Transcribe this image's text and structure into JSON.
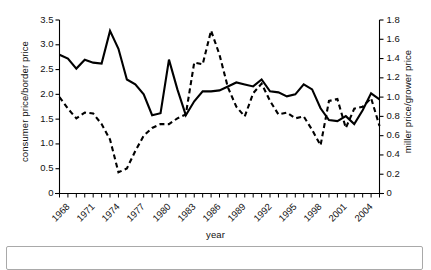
{
  "chart_data": {
    "type": "line",
    "title": "",
    "xlabel": "year",
    "ylabel": "consumer price/border price",
    "y2label": "miller price/grower price",
    "grid": false,
    "legend": "none",
    "xlim": [
      1968,
      2006
    ],
    "ylim": [
      0,
      3.5
    ],
    "y2lim": [
      0,
      1.8
    ],
    "x": [
      1968,
      1969,
      1970,
      1971,
      1972,
      1973,
      1974,
      1975,
      1976,
      1977,
      1978,
      1979,
      1980,
      1981,
      1982,
      1983,
      1984,
      1985,
      1986,
      1987,
      1988,
      1989,
      1990,
      1991,
      1992,
      1993,
      1994,
      1995,
      1996,
      1997,
      1998,
      1999,
      2000,
      2001,
      2002,
      2003,
      2004,
      2005,
      2006
    ],
    "xticks": [
      "1968",
      "1971",
      "1974",
      "1977",
      "1980",
      "1983",
      "1986",
      "1989",
      "1992",
      "1995",
      "1998",
      "2001",
      "2004"
    ],
    "xtick_values": [
      1968,
      1971,
      1974,
      1977,
      1980,
      1983,
      1986,
      1989,
      1992,
      1995,
      1998,
      2001,
      2004
    ],
    "yticks": [
      "0",
      "0.5",
      "1.0",
      "1.5",
      "2.0",
      "2.5",
      "3.0",
      "3.5"
    ],
    "ytick_values": [
      0,
      0.5,
      1.0,
      1.5,
      2.0,
      2.5,
      3.0,
      3.5
    ],
    "y2ticks": [
      "0",
      "0.2",
      "0.4",
      "0.6",
      "0.8",
      "1.0",
      "1.2",
      "1.4",
      "1.6",
      "1.8"
    ],
    "y2tick_values": [
      0,
      0.2,
      0.4,
      0.6,
      0.8,
      1.0,
      1.2,
      1.4,
      1.6,
      1.8
    ],
    "series": [
      {
        "name": "consumer price/border price",
        "axis": "left",
        "style": "solid",
        "color": "#000000",
        "values": [
          2.8,
          2.72,
          2.52,
          2.7,
          2.64,
          2.62,
          3.28,
          2.92,
          2.3,
          2.2,
          2.0,
          1.58,
          1.62,
          2.7,
          2.1,
          1.58,
          1.86,
          2.06,
          2.06,
          2.08,
          2.16,
          2.24,
          2.2,
          2.16,
          2.3,
          2.06,
          2.04,
          1.96,
          2.0,
          2.2,
          2.1,
          1.72,
          1.48,
          1.46,
          1.56,
          1.4,
          1.68,
          2.02,
          1.9
        ]
      },
      {
        "name": "miller price/grower price",
        "axis": "right",
        "style": "dashed",
        "color": "#000000",
        "values": [
          1.0,
          0.88,
          0.78,
          0.84,
          0.83,
          0.72,
          0.56,
          0.22,
          0.26,
          0.44,
          0.6,
          0.68,
          0.72,
          0.72,
          0.78,
          0.82,
          1.36,
          1.34,
          1.69,
          1.44,
          1.1,
          0.9,
          0.8,
          1.04,
          1.14,
          0.96,
          0.82,
          0.84,
          0.78,
          0.8,
          0.66,
          0.5,
          0.96,
          0.98,
          0.68,
          0.88,
          0.9,
          0.99,
          0.7
        ]
      }
    ]
  },
  "axes": {
    "left_title": "consumer price/border price",
    "right_title": "miller price/grower price",
    "x_title": "year"
  }
}
